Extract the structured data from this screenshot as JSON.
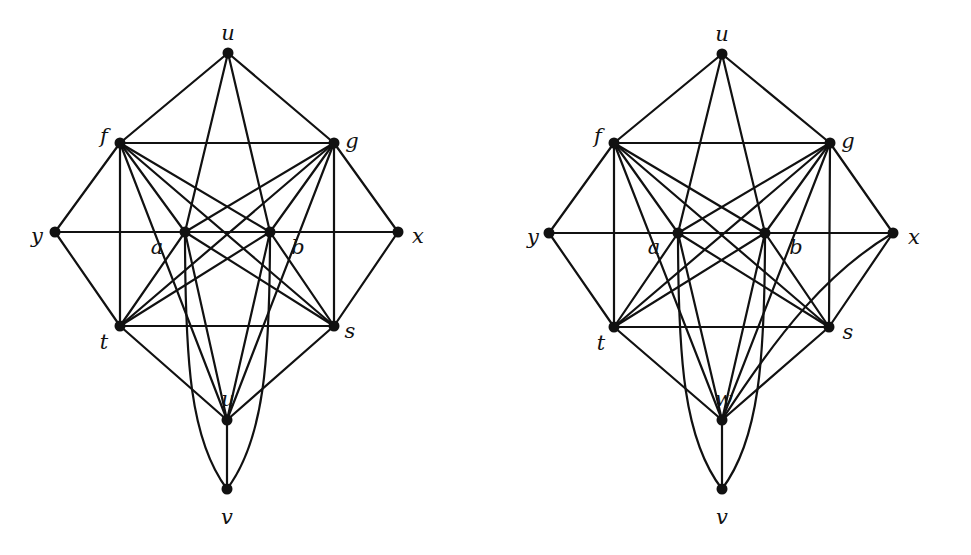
{
  "graphs": [
    {
      "id": "left",
      "nodes": [
        {
          "id": "u",
          "label": "u",
          "x": 228,
          "y": 53,
          "lx": 228,
          "ly": 40,
          "anchor": "middle"
        },
        {
          "id": "f",
          "label": "f",
          "x": 120,
          "y": 143,
          "lx": 104,
          "ly": 143,
          "anchor": "middle"
        },
        {
          "id": "g",
          "label": "g",
          "x": 334,
          "y": 143,
          "lx": 352,
          "ly": 148,
          "anchor": "middle"
        },
        {
          "id": "y",
          "label": "y",
          "x": 55,
          "y": 232,
          "lx": 37,
          "ly": 243,
          "anchor": "middle"
        },
        {
          "id": "a",
          "label": "a",
          "x": 185,
          "y": 232,
          "lx": 157,
          "ly": 254,
          "anchor": "middle"
        },
        {
          "id": "b",
          "label": "b",
          "x": 270,
          "y": 232,
          "lx": 298,
          "ly": 254,
          "anchor": "middle"
        },
        {
          "id": "x",
          "label": "x",
          "x": 398,
          "y": 232,
          "lx": 418,
          "ly": 243,
          "anchor": "middle"
        },
        {
          "id": "t",
          "label": "t",
          "x": 120,
          "y": 326,
          "lx": 104,
          "ly": 349,
          "anchor": "middle"
        },
        {
          "id": "s",
          "label": "s",
          "x": 334,
          "y": 326,
          "lx": 350,
          "ly": 338,
          "anchor": "middle"
        },
        {
          "id": "w",
          "label": "u",
          "x": 227,
          "y": 420,
          "lx": 228,
          "ly": 406,
          "anchor": "middle"
        },
        {
          "id": "v",
          "label": "v",
          "x": 227,
          "y": 489,
          "lx": 227,
          "ly": 524,
          "anchor": "middle"
        }
      ],
      "edges": [
        [
          "u",
          "f"
        ],
        [
          "u",
          "g"
        ],
        [
          "u",
          "a"
        ],
        [
          "u",
          "b"
        ],
        [
          "f",
          "g"
        ],
        [
          "f",
          "y"
        ],
        [
          "f",
          "t"
        ],
        [
          "f",
          "a"
        ],
        [
          "f",
          "b"
        ],
        [
          "f",
          "s"
        ],
        [
          "f",
          "w"
        ],
        [
          "g",
          "x"
        ],
        [
          "g",
          "s"
        ],
        [
          "g",
          "a"
        ],
        [
          "g",
          "b"
        ],
        [
          "g",
          "t"
        ],
        [
          "g",
          "w"
        ],
        [
          "y",
          "a"
        ],
        [
          "a",
          "b"
        ],
        [
          "b",
          "x"
        ],
        [
          "y",
          "t"
        ],
        [
          "x",
          "s"
        ],
        [
          "t",
          "s"
        ],
        [
          "t",
          "a"
        ],
        [
          "t",
          "b"
        ],
        [
          "t",
          "w"
        ],
        [
          "s",
          "a"
        ],
        [
          "s",
          "b"
        ],
        [
          "s",
          "w"
        ],
        [
          "a",
          "w"
        ],
        [
          "b",
          "w"
        ],
        [
          "w",
          "v"
        ]
      ],
      "curves": [
        {
          "from": "a",
          "to": "v",
          "path": "M185,232 C185,360 190,440 227,489"
        },
        {
          "from": "b",
          "to": "v",
          "path": "M270,232 C270,360 264,440 227,489"
        }
      ]
    },
    {
      "id": "right",
      "nodes": [
        {
          "id": "u",
          "label": "u",
          "x": 722,
          "y": 54,
          "lx": 722,
          "ly": 41,
          "anchor": "middle"
        },
        {
          "id": "f",
          "label": "f",
          "x": 614,
          "y": 143,
          "lx": 598,
          "ly": 143,
          "anchor": "middle"
        },
        {
          "id": "g",
          "label": "g",
          "x": 830,
          "y": 143,
          "lx": 848,
          "ly": 148,
          "anchor": "middle"
        },
        {
          "id": "y",
          "label": "y",
          "x": 549,
          "y": 233,
          "lx": 533,
          "ly": 244,
          "anchor": "middle"
        },
        {
          "id": "a",
          "label": "a",
          "x": 678,
          "y": 233,
          "lx": 654,
          "ly": 254,
          "anchor": "middle"
        },
        {
          "id": "b",
          "label": "b",
          "x": 765,
          "y": 233,
          "lx": 796,
          "ly": 254,
          "anchor": "middle"
        },
        {
          "id": "x",
          "label": "x",
          "x": 893,
          "y": 233,
          "lx": 914,
          "ly": 244,
          "anchor": "middle"
        },
        {
          "id": "t",
          "label": "t",
          "x": 614,
          "y": 327,
          "lx": 601,
          "ly": 350,
          "anchor": "middle"
        },
        {
          "id": "s",
          "label": "s",
          "x": 829,
          "y": 327,
          "lx": 848,
          "ly": 339,
          "anchor": "middle"
        },
        {
          "id": "w",
          "label": "w",
          "x": 722,
          "y": 420,
          "lx": 724,
          "ly": 406,
          "anchor": "middle"
        },
        {
          "id": "v",
          "label": "v",
          "x": 722,
          "y": 489,
          "lx": 722,
          "ly": 524,
          "anchor": "middle"
        }
      ],
      "edges": [
        [
          "u",
          "f"
        ],
        [
          "u",
          "g"
        ],
        [
          "u",
          "a"
        ],
        [
          "u",
          "b"
        ],
        [
          "f",
          "g"
        ],
        [
          "f",
          "y"
        ],
        [
          "f",
          "t"
        ],
        [
          "f",
          "a"
        ],
        [
          "f",
          "b"
        ],
        [
          "f",
          "s"
        ],
        [
          "f",
          "w"
        ],
        [
          "g",
          "x"
        ],
        [
          "g",
          "s"
        ],
        [
          "g",
          "a"
        ],
        [
          "g",
          "b"
        ],
        [
          "g",
          "t"
        ],
        [
          "g",
          "w"
        ],
        [
          "y",
          "a"
        ],
        [
          "a",
          "b"
        ],
        [
          "b",
          "x"
        ],
        [
          "y",
          "t"
        ],
        [
          "x",
          "s"
        ],
        [
          "t",
          "s"
        ],
        [
          "t",
          "a"
        ],
        [
          "t",
          "b"
        ],
        [
          "t",
          "w"
        ],
        [
          "s",
          "a"
        ],
        [
          "s",
          "b"
        ],
        [
          "s",
          "w"
        ],
        [
          "a",
          "w"
        ],
        [
          "b",
          "w"
        ],
        [
          "w",
          "v"
        ]
      ],
      "curves": [
        {
          "from": "a",
          "to": "v",
          "path": "M678,233 C678,360 684,440 722,489"
        },
        {
          "from": "b",
          "to": "v",
          "path": "M765,233 C765,360 759,440 722,489"
        },
        {
          "from": "x",
          "to": "w",
          "path": "M893,233 C830,270 780,330 722,420"
        }
      ]
    }
  ]
}
